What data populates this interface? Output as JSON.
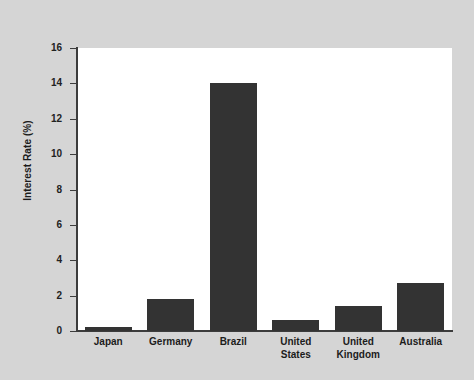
{
  "chart_data": {
    "type": "bar",
    "title": "",
    "subtitle": "",
    "xlabel": "",
    "ylabel": "Interest Rate (%)",
    "categories": [
      "Japan",
      "Germany",
      "Brazil",
      "United States",
      "United Kingdom",
      "Australia"
    ],
    "values": [
      0.2,
      1.8,
      14.0,
      0.6,
      1.4,
      2.7
    ],
    "series": [
      {
        "name": "Interest Rate (%)",
        "values": [
          0.2,
          1.8,
          14.0,
          0.6,
          1.4,
          2.7
        ]
      }
    ],
    "ylim": [
      0,
      16
    ],
    "yticks": [
      0,
      2,
      4,
      6,
      8,
      10,
      12,
      14,
      16
    ],
    "ytick_labels": [
      "0",
      "2",
      "4",
      "6",
      "8",
      "10",
      "12",
      "14",
      "16"
    ],
    "grid": false,
    "legend": false,
    "legend_position": "none",
    "bar_color": "#333333",
    "panel_color": "#ffffff",
    "figure_color": "#d5d5d5",
    "axis_color": "#3c3c3c",
    "annotations": []
  }
}
